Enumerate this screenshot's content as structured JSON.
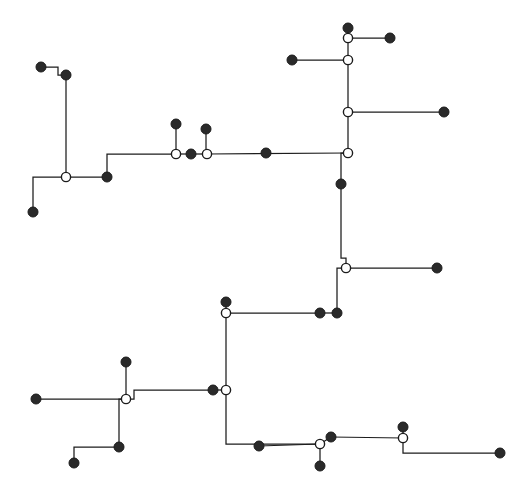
{
  "figure": {
    "title": "",
    "background_color": "#ffffff",
    "width": 514,
    "height": 497
  },
  "chart_data": {
    "type": "diagram",
    "subtype": "orthogonal-network-tree",
    "title": "",
    "subtitle": "",
    "xlabel": "",
    "ylabel": "",
    "xlim": [
      0,
      514
    ],
    "ylim": [
      0,
      497
    ],
    "grid": false,
    "legend": null,
    "annotations": [],
    "style": {
      "line_color": "#1c1c1c",
      "line_width": 1.25,
      "filled_node_color": "#2a2a2a",
      "open_node_fill": "#ffffff",
      "open_node_stroke": "#1c1c1c",
      "filled_node_radius": 5,
      "open_node_radius": 4.6,
      "routing": "rectilinear"
    },
    "node_types": {
      "filled": "terminal-node",
      "open": "junction-node"
    },
    "nodes": [
      {
        "id": "n1",
        "x": 41,
        "y": 67,
        "type": "filled"
      },
      {
        "id": "n2",
        "x": 66,
        "y": 75,
        "type": "filled"
      },
      {
        "id": "n3",
        "x": 66,
        "y": 177,
        "type": "open"
      },
      {
        "id": "n4",
        "x": 33,
        "y": 212,
        "type": "filled"
      },
      {
        "id": "n5",
        "x": 107,
        "y": 177,
        "type": "filled"
      },
      {
        "id": "n6",
        "x": 176,
        "y": 124,
        "type": "filled"
      },
      {
        "id": "n7",
        "x": 176,
        "y": 154,
        "type": "open"
      },
      {
        "id": "n8",
        "x": 191,
        "y": 154,
        "type": "filled"
      },
      {
        "id": "n9",
        "x": 206,
        "y": 129,
        "type": "filled"
      },
      {
        "id": "n10",
        "x": 207,
        "y": 154,
        "type": "open"
      },
      {
        "id": "n11",
        "x": 266,
        "y": 153,
        "type": "filled"
      },
      {
        "id": "n12",
        "x": 348,
        "y": 28,
        "type": "filled"
      },
      {
        "id": "n13",
        "x": 348,
        "y": 38,
        "type": "open"
      },
      {
        "id": "n14",
        "x": 390,
        "y": 38,
        "type": "filled"
      },
      {
        "id": "n15",
        "x": 348,
        "y": 60,
        "type": "open"
      },
      {
        "id": "n16",
        "x": 292,
        "y": 60,
        "type": "filled"
      },
      {
        "id": "n17",
        "x": 348,
        "y": 112,
        "type": "open"
      },
      {
        "id": "n18",
        "x": 444,
        "y": 112,
        "type": "filled"
      },
      {
        "id": "n19",
        "x": 348,
        "y": 153,
        "type": "open"
      },
      {
        "id": "n20",
        "x": 341,
        "y": 184,
        "type": "filled"
      },
      {
        "id": "n21",
        "x": 346,
        "y": 268,
        "type": "open"
      },
      {
        "id": "n22",
        "x": 437,
        "y": 268,
        "type": "filled"
      },
      {
        "id": "n23",
        "x": 337,
        "y": 313,
        "type": "filled"
      },
      {
        "id": "n24",
        "x": 320,
        "y": 313,
        "type": "filled"
      },
      {
        "id": "n25",
        "x": 226,
        "y": 313,
        "type": "open"
      },
      {
        "id": "n26",
        "x": 226,
        "y": 302,
        "type": "filled"
      },
      {
        "id": "n27",
        "x": 226,
        "y": 390,
        "type": "open"
      },
      {
        "id": "n28",
        "x": 213,
        "y": 390,
        "type": "filled"
      },
      {
        "id": "n29",
        "x": 126,
        "y": 399,
        "type": "open"
      },
      {
        "id": "n30",
        "x": 36,
        "y": 399,
        "type": "filled"
      },
      {
        "id": "n31",
        "x": 126,
        "y": 362,
        "type": "filled"
      },
      {
        "id": "n32",
        "x": 119,
        "y": 447,
        "type": "filled"
      },
      {
        "id": "n33",
        "x": 74,
        "y": 463,
        "type": "filled"
      },
      {
        "id": "n34",
        "x": 259,
        "y": 446,
        "type": "filled"
      },
      {
        "id": "n35",
        "x": 320,
        "y": 444,
        "type": "open"
      },
      {
        "id": "n36",
        "x": 331,
        "y": 437,
        "type": "filled"
      },
      {
        "id": "n37",
        "x": 320,
        "y": 466,
        "type": "filled"
      },
      {
        "id": "n38",
        "x": 403,
        "y": 438,
        "type": "open"
      },
      {
        "id": "n39",
        "x": 403,
        "y": 427,
        "type": "filled"
      },
      {
        "id": "n40",
        "x": 500,
        "y": 453,
        "type": "filled"
      }
    ],
    "edges": [
      {
        "from": "n1",
        "to": "n2",
        "path": [
          [
            41,
            67
          ],
          [
            58,
            67
          ],
          [
            58,
            75
          ],
          [
            66,
            75
          ]
        ]
      },
      {
        "from": "n2",
        "to": "n3",
        "path": [
          [
            66,
            75
          ],
          [
            66,
            177
          ]
        ]
      },
      {
        "from": "n3",
        "to": "n4",
        "path": [
          [
            66,
            177
          ],
          [
            33,
            177
          ],
          [
            33,
            212
          ]
        ]
      },
      {
        "from": "n3",
        "to": "n5",
        "path": [
          [
            66,
            177
          ],
          [
            107,
            177
          ]
        ]
      },
      {
        "from": "n5",
        "to": "n7",
        "path": [
          [
            107,
            177
          ],
          [
            107,
            154
          ],
          [
            176,
            154
          ]
        ]
      },
      {
        "from": "n6",
        "to": "n7",
        "path": [
          [
            176,
            124
          ],
          [
            176,
            154
          ]
        ]
      },
      {
        "from": "n7",
        "to": "n10",
        "path": [
          [
            176,
            154
          ],
          [
            207,
            154
          ]
        ]
      },
      {
        "from": "n9",
        "to": "n10",
        "path": [
          [
            206,
            129
          ],
          [
            206,
            154
          ]
        ]
      },
      {
        "from": "n10",
        "to": "n19",
        "path": [
          [
            207,
            154
          ],
          [
            348,
            153
          ]
        ]
      },
      {
        "from": "n12",
        "to": "n13",
        "path": [
          [
            348,
            28
          ],
          [
            348,
            38
          ]
        ]
      },
      {
        "from": "n13",
        "to": "n14",
        "path": [
          [
            348,
            38
          ],
          [
            390,
            38
          ]
        ]
      },
      {
        "from": "n13",
        "to": "n15",
        "path": [
          [
            348,
            38
          ],
          [
            348,
            60
          ]
        ]
      },
      {
        "from": "n15",
        "to": "n16",
        "path": [
          [
            348,
            60
          ],
          [
            292,
            60
          ]
        ]
      },
      {
        "from": "n15",
        "to": "n17",
        "path": [
          [
            348,
            60
          ],
          [
            348,
            112
          ]
        ]
      },
      {
        "from": "n17",
        "to": "n18",
        "path": [
          [
            348,
            112
          ],
          [
            444,
            112
          ]
        ]
      },
      {
        "from": "n17",
        "to": "n19",
        "path": [
          [
            348,
            112
          ],
          [
            348,
            153
          ]
        ]
      },
      {
        "from": "n19",
        "to": "n20",
        "path": [
          [
            348,
            153
          ],
          [
            341,
            153
          ],
          [
            341,
            184
          ]
        ]
      },
      {
        "from": "n20",
        "to": "n21",
        "path": [
          [
            341,
            184
          ],
          [
            341,
            258
          ],
          [
            346,
            258
          ],
          [
            346,
            268
          ]
        ]
      },
      {
        "from": "n21",
        "to": "n22",
        "path": [
          [
            346,
            268
          ],
          [
            437,
            268
          ]
        ]
      },
      {
        "from": "n21",
        "to": "n23",
        "path": [
          [
            346,
            268
          ],
          [
            337,
            268
          ],
          [
            337,
            313
          ]
        ]
      },
      {
        "from": "n23",
        "to": "n24",
        "path": [
          [
            337,
            313
          ],
          [
            320,
            313
          ]
        ]
      },
      {
        "from": "n24",
        "to": "n25",
        "path": [
          [
            320,
            313
          ],
          [
            226,
            313
          ]
        ]
      },
      {
        "from": "n25",
        "to": "n26",
        "path": [
          [
            226,
            302
          ],
          [
            226,
            313
          ]
        ]
      },
      {
        "from": "n25",
        "to": "n27",
        "path": [
          [
            226,
            313
          ],
          [
            226,
            390
          ]
        ]
      },
      {
        "from": "n27",
        "to": "n28",
        "path": [
          [
            226,
            390
          ],
          [
            213,
            390
          ]
        ]
      },
      {
        "from": "n28",
        "to": "n29",
        "path": [
          [
            213,
            390
          ],
          [
            134,
            390
          ],
          [
            134,
            399
          ],
          [
            126,
            399
          ]
        ]
      },
      {
        "from": "n29",
        "to": "n31",
        "path": [
          [
            126,
            399
          ],
          [
            126,
            362
          ]
        ]
      },
      {
        "from": "n29",
        "to": "n30",
        "path": [
          [
            126,
            399
          ],
          [
            36,
            399
          ]
        ]
      },
      {
        "from": "n29",
        "to": "n32",
        "path": [
          [
            126,
            399
          ],
          [
            119,
            399
          ],
          [
            119,
            447
          ]
        ]
      },
      {
        "from": "n32",
        "to": "n33",
        "path": [
          [
            119,
            447
          ],
          [
            74,
            447
          ],
          [
            74,
            463
          ]
        ]
      },
      {
        "from": "n27",
        "to": "n35",
        "path": [
          [
            226,
            390
          ],
          [
            226,
            444
          ],
          [
            320,
            444
          ]
        ]
      },
      {
        "from": "n34",
        "to": "n35",
        "path": [
          [
            259,
            446
          ],
          [
            320,
            444
          ]
        ]
      },
      {
        "from": "n35",
        "to": "n36",
        "path": [
          [
            320,
            444
          ],
          [
            331,
            437
          ]
        ]
      },
      {
        "from": "n35",
        "to": "n37",
        "path": [
          [
            320,
            444
          ],
          [
            320,
            466
          ]
        ]
      },
      {
        "from": "n36",
        "to": "n38",
        "path": [
          [
            331,
            437
          ],
          [
            403,
            438
          ]
        ]
      },
      {
        "from": "n38",
        "to": "n39",
        "path": [
          [
            403,
            427
          ],
          [
            403,
            438
          ]
        ]
      },
      {
        "from": "n38",
        "to": "n40",
        "path": [
          [
            403,
            438
          ],
          [
            403,
            453
          ],
          [
            500,
            453
          ]
        ]
      }
    ]
  }
}
